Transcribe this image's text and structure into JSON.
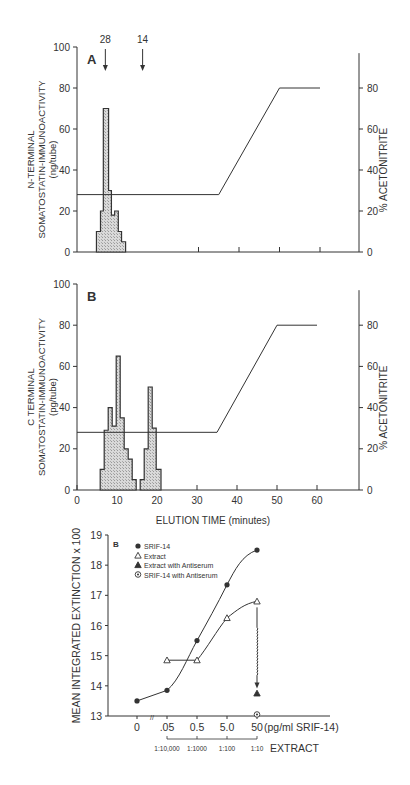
{
  "chart_data": [
    {
      "panel": "A",
      "type": "bar",
      "subtype": "histogram-step-with-gradient-line",
      "ylabel": [
        "N-TERMINAL",
        "SOMATOSTATIN-IMMUNOACTIVITY",
        "(ng/tube)"
      ],
      "ylabel_right": "% ACETONITRITE",
      "xlabel": "",
      "ylim": [
        0,
        100
      ],
      "yticks": [
        0,
        20,
        40,
        60,
        80,
        100
      ],
      "ylim_right": [
        0,
        100
      ],
      "yticks_right": [
        0,
        20,
        40,
        60,
        80
      ],
      "xlim": [
        0,
        70
      ],
      "xticks_marks": [
        30,
        40,
        50,
        60
      ],
      "markers": [
        {
          "label": "28",
          "x": 7.0
        },
        {
          "label": "14",
          "x": 16.2
        }
      ],
      "histogram": [
        {
          "x0": 4.8,
          "x1": 5.8,
          "value": 10
        },
        {
          "x0": 5.8,
          "x1": 6.5,
          "value": 20
        },
        {
          "x0": 6.5,
          "x1": 7.8,
          "value": 70
        },
        {
          "x0": 7.8,
          "x1": 8.5,
          "value": 30
        },
        {
          "x0": 8.5,
          "x1": 9.3,
          "value": 18
        },
        {
          "x0": 9.3,
          "x1": 10.2,
          "value": 20
        },
        {
          "x0": 10.2,
          "x1": 11.0,
          "value": 10
        },
        {
          "x0": 11.0,
          "x1": 12.0,
          "value": 5
        }
      ],
      "gradient_line": {
        "name": "% Acetonitrite",
        "x": [
          0,
          35,
          50,
          60
        ],
        "values": [
          28,
          28,
          80,
          80
        ]
      }
    },
    {
      "panel": "B",
      "type": "bar",
      "subtype": "histogram-step-with-gradient-line",
      "ylabel": [
        "C TERMINAL",
        "SOMATOSTATIN-IMMUNOACTIVITY",
        "(pg/tube)"
      ],
      "ylabel_right": "% ACETONITRITE",
      "xlabel": "ELUTION TIME (minutes)",
      "ylim": [
        0,
        100
      ],
      "yticks": [
        0,
        20,
        40,
        60,
        80,
        100
      ],
      "ylim_right": [
        0,
        100
      ],
      "yticks_right": [
        0,
        20,
        40,
        60,
        80
      ],
      "xlim": [
        0,
        70
      ],
      "xticks": [
        0,
        10,
        20,
        30,
        40,
        50,
        60
      ],
      "histogram": [
        {
          "x0": 5.8,
          "x1": 6.8,
          "value": 10
        },
        {
          "x0": 6.8,
          "x1": 7.8,
          "value": 29
        },
        {
          "x0": 7.8,
          "x1": 8.8,
          "value": 40
        },
        {
          "x0": 8.8,
          "x1": 9.8,
          "value": 31
        },
        {
          "x0": 9.8,
          "x1": 10.8,
          "value": 65
        },
        {
          "x0": 10.8,
          "x1": 11.8,
          "value": 35
        },
        {
          "x0": 11.8,
          "x1": 12.8,
          "value": 20
        },
        {
          "x0": 12.8,
          "x1": 13.8,
          "value": 15
        },
        {
          "x0": 13.8,
          "x1": 14.8,
          "value": 5
        },
        {
          "x0": 15.8,
          "x1": 16.8,
          "value": 5
        },
        {
          "x0": 16.8,
          "x1": 17.8,
          "value": 20
        },
        {
          "x0": 17.8,
          "x1": 18.8,
          "value": 50
        },
        {
          "x0": 18.8,
          "x1": 19.8,
          "value": 30
        },
        {
          "x0": 19.8,
          "x1": 21.0,
          "value": 10
        }
      ],
      "gradient_line": {
        "name": "% Acetonitrite",
        "x": [
          0,
          35,
          50,
          60
        ],
        "values": [
          28,
          28,
          80,
          80
        ]
      }
    },
    {
      "panel": "B (bioassay)",
      "type": "line",
      "ylabel": "MEAN INTEGRATED EXTINCTION x 100",
      "xlabel": "(pg/ml SRIF-14)",
      "xlabel_secondary": "EXTRACT",
      "ylim": [
        13,
        19
      ],
      "yticks": [
        13,
        14,
        15,
        16,
        17,
        18,
        19
      ],
      "categories": [
        "0",
        ".05",
        "0.5",
        "5.0",
        "50"
      ],
      "categories_secondary": [
        "1:10,000",
        "1:1000",
        "1:100",
        "1:10"
      ],
      "legend_position": "upper-left",
      "series": [
        {
          "name": "SRIF-14",
          "marker": "filled-circle",
          "x": [
            "0",
            ".05",
            "0.5",
            "5.0",
            "50"
          ],
          "values": [
            13.5,
            13.85,
            15.5,
            17.35,
            18.5
          ]
        },
        {
          "name": "Extract",
          "marker": "open-triangle",
          "x": [
            ".05",
            "0.5",
            "5.0",
            "50"
          ],
          "values": [
            14.85,
            14.85,
            16.25,
            16.8
          ]
        },
        {
          "name": "Extract with Antiserum",
          "marker": "filled-triangle",
          "x": [
            "50"
          ],
          "values": [
            13.75
          ]
        },
        {
          "name": "SRIF-14 with Antiserum",
          "marker": "circled-dot",
          "x": [
            "50"
          ],
          "values": [
            13.05
          ]
        }
      ],
      "annotations": [
        "wavy arrow from Extract (50) down to Extract with Antiserum (50)"
      ]
    }
  ],
  "labels": {
    "panelA": "A",
    "panelB": "B",
    "panelC": "B",
    "markerA1": "28",
    "markerA2": "14",
    "ylabelA": [
      "N-TERMINAL",
      "SOMATOSTATIN-IMMUNOACTIVITY",
      "(ng/tube)"
    ],
    "ylabelB": [
      "C TERMINAL",
      "SOMATOSTATIN-IMMUNOACTIVITY",
      "(pg/tube)"
    ],
    "ylabelRight": "% ACETONITRITE",
    "xlabelB": "ELUTION TIME (minutes)",
    "ylabelC": "MEAN INTEGRATED EXTINCTION x 100",
    "xunitC": "(pg/ml SRIF-14)",
    "extractLabel": "EXTRACT"
  },
  "colors": {
    "ink": "#333333",
    "hatch": "#c8c8c8",
    "background": "#ffffff"
  }
}
